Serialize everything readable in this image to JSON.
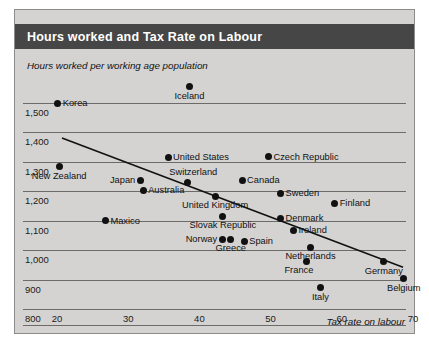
{
  "header": {
    "title": "Hours worked and  Tax Rate on Labour"
  },
  "chart_data": {
    "type": "scatter",
    "title": "Hours worked and  Tax Rate on Labour",
    "xlabel": "Tax rate on labour",
    "ylabel": "Hours worked per working age population",
    "xlim": [
      20,
      70
    ],
    "ylim": [
      800,
      1500
    ],
    "xticks": [
      "20",
      "30",
      "40",
      "50",
      "60",
      "70"
    ],
    "yticks": [
      "1,500",
      "1,400",
      "1,300",
      "1,200",
      "1,100",
      "1,000",
      "900",
      "800"
    ],
    "grid": true,
    "legend": "none",
    "points": [
      {
        "label": "Korea",
        "x": 20.1,
        "y": 1500,
        "pos": "right"
      },
      {
        "label": "Iceland",
        "x": 38.6,
        "y": 1556,
        "pos": "below"
      },
      {
        "label": "New Zealand",
        "x": 20.3,
        "y": 1283,
        "pos": "below"
      },
      {
        "label": "United States",
        "x": 35.6,
        "y": 1315,
        "pos": "right"
      },
      {
        "label": "Czech Republic",
        "x": 49.7,
        "y": 1318,
        "pos": "right"
      },
      {
        "label": "Japan",
        "x": 31.7,
        "y": 1237,
        "pos": "left"
      },
      {
        "label": "Australia",
        "x": 32.1,
        "y": 1203,
        "pos": "right"
      },
      {
        "label": "Switzerland",
        "x": 38.3,
        "y": 1230,
        "pos": "above-left"
      },
      {
        "label": "Canada",
        "x": 46.0,
        "y": 1237,
        "pos": "right"
      },
      {
        "label": "Sweden",
        "x": 51.4,
        "y": 1193,
        "pos": "right"
      },
      {
        "label": "United Kingdom",
        "x": 42.2,
        "y": 1183,
        "pos": "below"
      },
      {
        "label": "Finland",
        "x": 59.0,
        "y": 1160,
        "pos": "right"
      },
      {
        "label": "Maxico",
        "x": 26.8,
        "y": 1100,
        "pos": "right"
      },
      {
        "label": "Slovak Republic",
        "x": 43.3,
        "y": 1115,
        "pos": "below"
      },
      {
        "label": "Denmark",
        "x": 51.4,
        "y": 1108,
        "pos": "right"
      },
      {
        "label": "Ireland",
        "x": 53.2,
        "y": 1068,
        "pos": "right"
      },
      {
        "label": "Norway",
        "x": 43.2,
        "y": 1037,
        "pos": "left"
      },
      {
        "label": "Greece",
        "x": 44.4,
        "y": 1037,
        "pos": "below"
      },
      {
        "label": "Spain",
        "x": 46.3,
        "y": 1030,
        "pos": "right"
      },
      {
        "label": "Netherlands",
        "x": 55.6,
        "y": 1010,
        "pos": "below"
      },
      {
        "label": "France",
        "x": 55.1,
        "y": 963,
        "pos": "below-left"
      },
      {
        "label": "Germany",
        "x": 65.9,
        "y": 960,
        "pos": "below"
      },
      {
        "label": "Belgium",
        "x": 68.7,
        "y": 903,
        "pos": "below"
      },
      {
        "label": "Italy",
        "x": 57.0,
        "y": 873,
        "pos": "below"
      }
    ],
    "trendline": {
      "name": "linear fit",
      "x_start": 20.7,
      "y_start": 1381,
      "x_end": 68.6,
      "y_end": 942
    }
  }
}
